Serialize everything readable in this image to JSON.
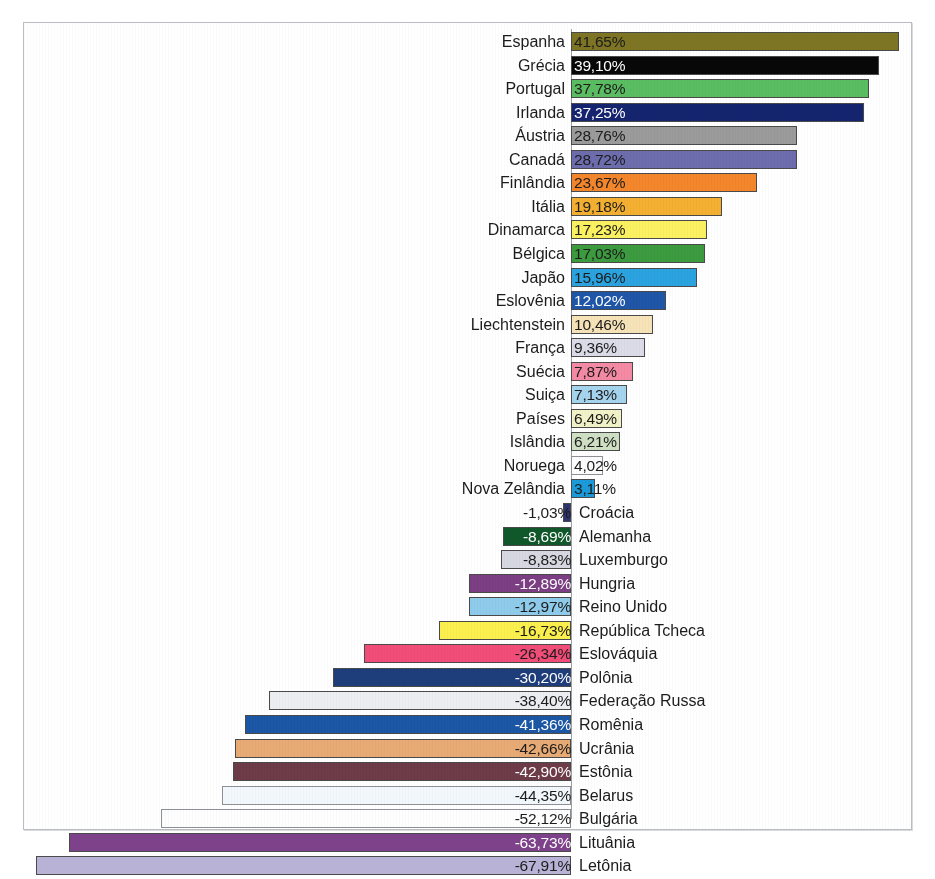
{
  "chart_data": {
    "type": "bar",
    "orientation": "horizontal",
    "title": "",
    "subtitle": "",
    "xlabel": "",
    "ylabel": "",
    "grid": false,
    "legend": "none",
    "value_suffix": "%",
    "decimal_separator": ",",
    "xlim": [
      -67.91,
      41.65
    ],
    "zero_axis": true,
    "categories": [
      "Espanha",
      "Grécia",
      "Portugal",
      "Irlanda",
      "Áustria",
      "Canadá",
      "Finlândia",
      "Itália",
      "Dinamarca",
      "Bélgica",
      "Japão",
      "Eslovênia",
      "Liechtenstein",
      "França",
      "Suécia",
      "Suiça",
      "Países",
      "Islândia",
      "Noruega",
      "Nova Zelândia",
      "Croácia",
      "Alemanha",
      "Luxemburgo",
      "Hungria",
      "Reino Unido",
      "República Tcheca",
      "Eslováquia",
      "Polônia",
      "Federação Russa",
      "Romênia",
      "Ucrânia",
      "Estônia",
      "Belarus",
      "Bulgária",
      "Lituânia",
      "Letônia"
    ],
    "values": [
      41.65,
      39.1,
      37.78,
      37.25,
      28.76,
      28.72,
      23.67,
      19.18,
      17.23,
      17.03,
      15.96,
      12.02,
      10.46,
      9.36,
      7.87,
      7.13,
      6.49,
      6.21,
      4.02,
      3.11,
      -1.03,
      -8.69,
      -8.83,
      -12.89,
      -12.97,
      -16.73,
      -26.34,
      -30.2,
      -38.4,
      -41.36,
      -42.66,
      -42.9,
      -44.35,
      -52.12,
      -63.73,
      -67.91
    ],
    "value_labels": [
      "41,65%",
      "39,10%",
      "37,78%",
      "37,25%",
      "28,76%",
      "28,72%",
      "23,67%",
      "19,18%",
      "17,23%",
      "17,03%",
      "15,96%",
      "12,02%",
      "10,46%",
      "9,36%",
      "7,87%",
      "7,13%",
      "6,49%",
      "6,21%",
      "4,02%",
      "3,11%",
      "-1,03%",
      "-8,69%",
      "-8,83%",
      "-12,89%",
      "-12,97%",
      "-16,73%",
      "-26,34%",
      "-30,20%",
      "-38,40%",
      "-41,36%",
      "-42,66%",
      "-42,90%",
      "-44,35%",
      "-52,12%",
      "-63,73%",
      "-67,91%"
    ],
    "bar_colors": [
      "#7e7524",
      "#080808",
      "#5bbd62",
      "#15246e",
      "#9b9b9b",
      "#6d6dae",
      "#f4862c",
      "#f4b031",
      "#fbf161",
      "#3d9b3f",
      "#2ba3e0",
      "#1f56a8",
      "#f7e3b8",
      "#dcdce8",
      "#f58aa5",
      "#a5d4ee",
      "#f2f3c8",
      "#cfe0c4",
      "#fdfdfd",
      "#1c9ada",
      "#2e3470",
      "#10582a",
      "#d8d8e2",
      "#7c3f83",
      "#8fcbea",
      "#fbf04e",
      "#f24d78",
      "#1e3d7b",
      "#eceef2",
      "#1b57a5",
      "#e8ab76",
      "#6e3b48",
      "#f2f8fb",
      "#fefefe",
      "#7d4289",
      "#b8b3d6"
    ],
    "label_text_colors": [
      "#1c1c1c",
      "#ffffff",
      "#1c1c1c",
      "#ffffff",
      "#1c1c1c",
      "#1c1c1c",
      "#1c1c1c",
      "#1c1c1c",
      "#1c1c1c",
      "#1c1c1c",
      "#1c1c1c",
      "#ffffff",
      "#1c1c1c",
      "#1c1c1c",
      "#1c1c1c",
      "#1c1c1c",
      "#1c1c1c",
      "#1c1c1c",
      "#1c1c1c",
      "#1c1c1c",
      "#1c1c1c",
      "#ffffff",
      "#1c1c1c",
      "#ffffff",
      "#1c1c1c",
      "#1c1c1c",
      "#1c1c1c",
      "#ffffff",
      "#1c1c1c",
      "#ffffff",
      "#1c1c1c",
      "#ffffff",
      "#1c1c1c",
      "#1c1c1c",
      "#ffffff",
      "#1c1c1c"
    ]
  }
}
